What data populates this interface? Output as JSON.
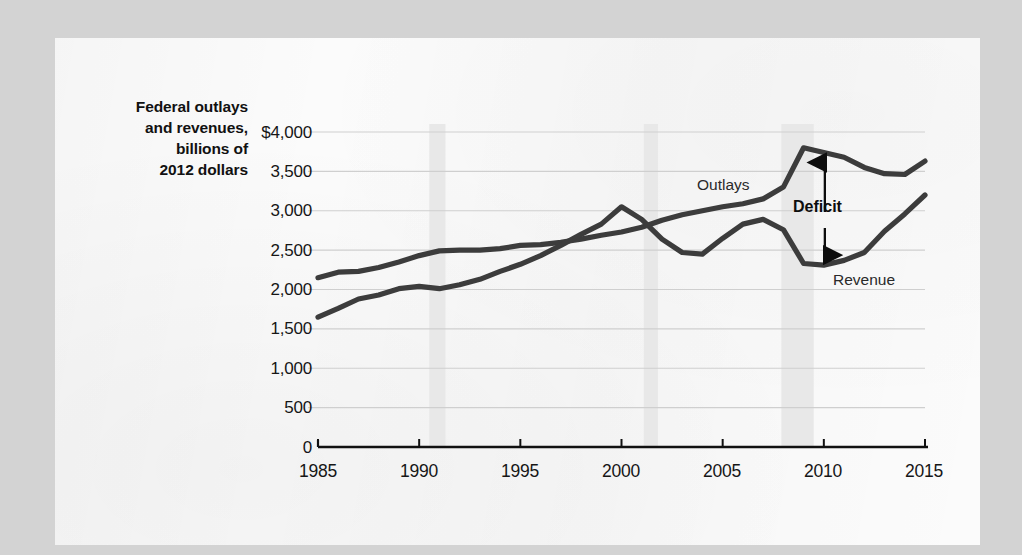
{
  "page": {
    "background_color": "#d3d3d3",
    "paper_color": "#fbfbfb"
  },
  "chart_data": {
    "type": "line",
    "title": "",
    "subtitle": "",
    "xlabel": "",
    "ylabel": "Federal outlays and revenues, billions of 2012 dollars",
    "ylabel_lines": [
      "Federal outlays",
      "and revenues,",
      "billions of",
      "2012 dollars"
    ],
    "ylim": [
      0,
      4000
    ],
    "xlim": [
      1985,
      2015
    ],
    "ytick_labels": [
      "$4,000",
      "3,500",
      "3,000",
      "2,500",
      "2,000",
      "1,500",
      "1,000",
      "500",
      "0"
    ],
    "ytick_values": [
      4000,
      3500,
      3000,
      2500,
      2000,
      1500,
      1000,
      500,
      0
    ],
    "xtick_labels": [
      "1985",
      "1990",
      "1995",
      "2000",
      "2005",
      "2010",
      "2015"
    ],
    "xtick_values": [
      1985,
      1990,
      1995,
      2000,
      2005,
      2010,
      2015
    ],
    "grid": true,
    "grid_color": "#cfcfcf",
    "legend": "none",
    "series_color": "#3c3c3c",
    "x": [
      1985,
      1986,
      1987,
      1988,
      1989,
      1990,
      1991,
      1992,
      1993,
      1994,
      1995,
      1996,
      1997,
      1998,
      1999,
      2000,
      2001,
      2002,
      2003,
      2004,
      2005,
      2006,
      2007,
      2008,
      2009,
      2010,
      2011,
      2012,
      2013,
      2014,
      2015
    ],
    "series": [
      {
        "name": "Outlays",
        "values": [
          2150,
          2220,
          2230,
          2280,
          2350,
          2430,
          2490,
          2500,
          2500,
          2520,
          2560,
          2570,
          2600,
          2640,
          2690,
          2730,
          2790,
          2880,
          2950,
          3000,
          3050,
          3090,
          3150,
          3300,
          3800,
          3740,
          3680,
          3550,
          3470,
          3460,
          3630
        ]
      },
      {
        "name": "Revenue",
        "values": [
          1650,
          1760,
          1880,
          1930,
          2010,
          2040,
          2010,
          2060,
          2130,
          2230,
          2320,
          2430,
          2560,
          2700,
          2830,
          3050,
          2890,
          2640,
          2470,
          2450,
          2650,
          2830,
          2890,
          2760,
          2330,
          2310,
          2370,
          2470,
          2740,
          2960,
          3200
        ]
      }
    ],
    "shaded_regions": [
      {
        "name": "recession-1990",
        "start": 1990.5,
        "end": 1991.3,
        "color": "#e8e8e8"
      },
      {
        "name": "recession-2001",
        "start": 2001.1,
        "end": 2001.8,
        "color": "#e8e8e8"
      },
      {
        "name": "recession-2008",
        "start": 2007.9,
        "end": 2009.5,
        "color": "#e8e8e8"
      }
    ],
    "annotations": [
      {
        "name": "outlays-label",
        "text": "Outlays",
        "bold": false
      },
      {
        "name": "revenue-label",
        "text": "Revenue",
        "bold": false
      },
      {
        "name": "deficit-label",
        "text": "Deficit",
        "bold": true
      }
    ]
  }
}
